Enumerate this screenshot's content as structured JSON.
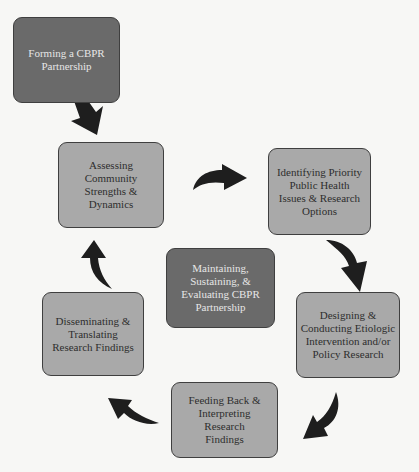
{
  "diagram": {
    "nodes": [
      {
        "id": "forming",
        "label": "Forming a CBPR Partnership",
        "style": "dark"
      },
      {
        "id": "assessing",
        "label": "Assessing Community Strengths & Dynamics",
        "style": "light"
      },
      {
        "id": "identifying",
        "label": "Identifying Priority Public Health Issues & Research Options",
        "style": "light"
      },
      {
        "id": "maintaining",
        "label": "Maintaining, Sustaining, & Evaluating CBPR Partnership",
        "style": "dark"
      },
      {
        "id": "disseminating",
        "label": "Disseminating & Translating Research Findings",
        "style": "light"
      },
      {
        "id": "designing",
        "label": "Designing & Conducting Etiologic Intervention and/or Policy Research",
        "style": "light"
      },
      {
        "id": "feeding",
        "label": "Feeding Back & Interpreting Research Findings",
        "style": "light"
      }
    ],
    "edges": [
      {
        "from": "forming",
        "to": "assessing"
      },
      {
        "from": "assessing",
        "to": "identifying"
      },
      {
        "from": "identifying",
        "to": "designing"
      },
      {
        "from": "designing",
        "to": "feeding"
      },
      {
        "from": "feeding",
        "to": "disseminating"
      },
      {
        "from": "disseminating",
        "to": "assessing"
      }
    ],
    "colors": {
      "dark_box": "#6a6a6a",
      "light_box": "#a9a9a9",
      "arrow": "#1e1e1e",
      "background": "#f7f7f5"
    }
  }
}
